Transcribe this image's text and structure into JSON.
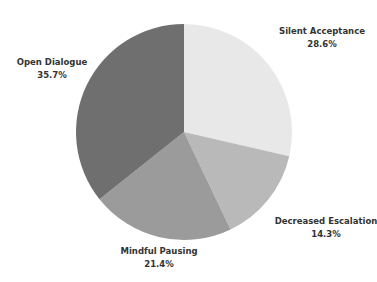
{
  "chart_data": {
    "type": "pie",
    "title": "",
    "start_angle_deg": 0,
    "direction": "clockwise",
    "center": [
      184,
      132
    ],
    "radius": 108,
    "categories": [
      "Silent Acceptance",
      "Decreased Escalation",
      "Mindful Pausing",
      "Open Dialogue"
    ],
    "values": [
      28.6,
      14.3,
      21.4,
      35.7
    ],
    "value_labels": [
      "28.6%",
      "14.3%",
      "21.4%",
      "35.7%"
    ],
    "colors": [
      "#e8e8e8",
      "#b9b9b9",
      "#9b9b9b",
      "#6f6f6f"
    ],
    "legend": "none",
    "label_positions": [
      {
        "x": 322,
        "y": 25
      },
      {
        "x": 326,
        "y": 215
      },
      {
        "x": 159,
        "y": 245
      },
      {
        "x": 52,
        "y": 56
      }
    ]
  },
  "labels": [
    {
      "name": "Silent Acceptance",
      "value": "28.6%"
    },
    {
      "name": "Decreased Escalation",
      "value": "14.3%"
    },
    {
      "name": "Mindful Pausing",
      "value": "21.4%"
    },
    {
      "name": "Open Dialogue",
      "value": "35.7%"
    }
  ]
}
